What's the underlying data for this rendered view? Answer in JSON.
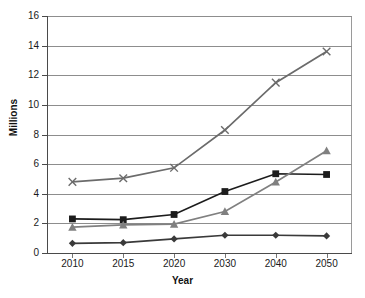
{
  "chart_data": {
    "type": "line",
    "title": "",
    "xlabel": "Year",
    "ylabel": "Millions",
    "categories": [
      "2010",
      "2015",
      "2020",
      "2030",
      "2040",
      "2050"
    ],
    "x": [
      2010,
      2015,
      2020,
      2030,
      2040,
      2050
    ],
    "ylim": [
      0,
      16
    ],
    "yticks": [
      0,
      2,
      4,
      6,
      8,
      10,
      12,
      14,
      16
    ],
    "ytick_labels": [
      "0",
      "2",
      "4",
      "6",
      "8",
      "10",
      "12",
      "14",
      "16"
    ],
    "grid": true,
    "legend": "none",
    "series": [
      {
        "name": "series-1-diamond",
        "marker": "diamond",
        "color": "#3a3a3a",
        "values": [
          0.65,
          0.7,
          0.95,
          1.2,
          1.2,
          1.15
        ]
      },
      {
        "name": "series-2-square",
        "marker": "square",
        "color": "#1c1c1c",
        "values": [
          2.3,
          2.25,
          2.6,
          4.15,
          5.35,
          5.3
        ]
      },
      {
        "name": "series-3-triangle",
        "marker": "triangle",
        "color": "#808080",
        "values": [
          1.75,
          1.9,
          1.95,
          2.8,
          4.8,
          6.9
        ]
      },
      {
        "name": "series-4-cross",
        "marker": "x-cross",
        "color": "#6b6b6b",
        "values": [
          4.8,
          5.05,
          5.75,
          8.3,
          11.5,
          13.6
        ]
      }
    ]
  },
  "axes": {
    "y_title": "Millions",
    "x_title": "Year"
  }
}
